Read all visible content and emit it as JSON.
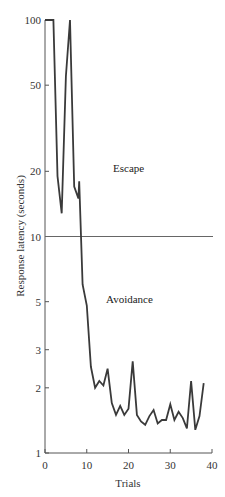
{
  "chart_data": {
    "type": "line",
    "title": "",
    "xlabel": "Trials",
    "ylabel": "Response latency (seconds)",
    "yscale": "log",
    "xlim": [
      0,
      40
    ],
    "ylim": [
      1,
      100
    ],
    "x_ticks": [
      0,
      10,
      20,
      30,
      40
    ],
    "y_ticks": [
      1,
      2,
      3,
      5,
      10,
      20,
      50,
      100
    ],
    "grid": false,
    "legend": null,
    "reference_lines": [
      {
        "axis": "y",
        "value": 10,
        "description": "threshold separating escape and avoidance"
      }
    ],
    "annotations": [
      {
        "text": "Escape",
        "region": "above 10 s"
      },
      {
        "text": "Avoidance",
        "region": "below 10 s"
      }
    ],
    "series": [
      {
        "name": "Response latency",
        "x": [
          0,
          1,
          2,
          3,
          4,
          5,
          6,
          7,
          8,
          8.2,
          9,
          10,
          11,
          12,
          13,
          14,
          15,
          16,
          17,
          18,
          19,
          20,
          21,
          22,
          23,
          24,
          25,
          26,
          27,
          28,
          29,
          30,
          31,
          32,
          33,
          34,
          35,
          36,
          37,
          38
        ],
        "values": [
          100,
          100,
          100,
          19,
          12.8,
          55,
          100,
          17,
          15,
          18,
          6,
          4.8,
          2.5,
          2.0,
          2.15,
          2.05,
          2.45,
          1.7,
          1.5,
          1.65,
          1.5,
          1.6,
          2.65,
          1.5,
          1.4,
          1.35,
          1.48,
          1.58,
          1.37,
          1.42,
          1.42,
          1.68,
          1.42,
          1.55,
          1.45,
          1.3,
          2.15,
          1.28,
          1.48,
          2.1
        ]
      }
    ]
  },
  "labels": {
    "escape": "Escape",
    "avoidance": "Avoidance",
    "xlabel": "Trials",
    "ylabel": "Response latency (seconds)"
  },
  "style": {
    "line_color": "#3a3a3a",
    "axis_color": "#555555",
    "ref_line_color": "#666666"
  }
}
